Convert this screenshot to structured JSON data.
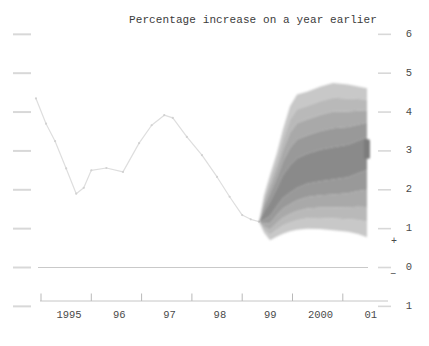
{
  "colors": {
    "background": "#ffffff",
    "history_line": "#dedede",
    "history_marker": "#d2d2d2",
    "zero_line": "#c9c9c9",
    "axis_line": "#c6c6c6",
    "axis_tick": "#b9b9b9",
    "side_tick": "#d8d8d8",
    "label_text": "#4a4a4a",
    "title_text": "#3b3b3b"
  },
  "chart_data": {
    "type": "area",
    "subtype": "fan-chart-projection",
    "title": "Percentage increase on a year earlier",
    "sign_labels": {
      "plus": "+",
      "minus": "−"
    },
    "y_axis": {
      "side": "right",
      "min": -1,
      "max": 6,
      "tick_values": [
        6,
        5,
        4,
        3,
        2,
        1,
        0,
        -1
      ],
      "tick_labels": [
        "6",
        "5",
        "4",
        "3",
        "2",
        "1",
        "0",
        "1"
      ]
    },
    "x_axis": {
      "tick_years": [
        1995,
        1996,
        1997,
        1998,
        1999,
        2000,
        2001
      ],
      "tick_labels": [
        "1995",
        "96",
        "97",
        "98",
        "99",
        "2000",
        "01"
      ]
    },
    "history_series": {
      "name": "outturn",
      "points": [
        [
          1994.9,
          4.35
        ],
        [
          1995.1,
          3.7
        ],
        [
          1995.28,
          3.25
        ],
        [
          1995.5,
          2.55
        ],
        [
          1995.7,
          1.9
        ],
        [
          1995.85,
          2.05
        ],
        [
          1996.0,
          2.5
        ],
        [
          1996.3,
          2.56
        ],
        [
          1996.63,
          2.46
        ],
        [
          1996.95,
          3.2
        ],
        [
          1997.2,
          3.66
        ],
        [
          1997.45,
          3.92
        ],
        [
          1997.62,
          3.85
        ],
        [
          1997.9,
          3.36
        ],
        [
          1998.2,
          2.89
        ],
        [
          1998.5,
          2.33
        ],
        [
          1998.75,
          1.82
        ],
        [
          1999.0,
          1.35
        ],
        [
          1999.17,
          1.24
        ],
        [
          1999.334,
          1.18
        ]
      ]
    },
    "fan": {
      "fractions": [
        0.22,
        0.45,
        0.65,
        0.82,
        1.0
      ],
      "shades": [
        "#c8c8c8",
        "#b9b9b9",
        "#a9a9a9",
        "#999999",
        "#8a8a8a"
      ],
      "stations": [
        [
          1999.334,
          1.18,
          1.18,
          1.18
        ],
        [
          1999.433,
          0.9,
          1.32,
          1.85
        ],
        [
          1999.553,
          0.7,
          1.5,
          2.38
        ],
        [
          1999.692,
          0.8,
          1.8,
          2.95
        ],
        [
          1999.811,
          0.87,
          2.05,
          3.55
        ],
        [
          1999.95,
          0.93,
          2.2,
          4.15
        ],
        [
          2000.09,
          0.97,
          2.35,
          4.45
        ],
        [
          2000.288,
          1.0,
          2.48,
          4.52
        ],
        [
          2000.547,
          0.99,
          2.57,
          4.65
        ],
        [
          2000.805,
          0.96,
          2.63,
          4.75
        ],
        [
          2001.103,
          0.92,
          2.72,
          4.71
        ],
        [
          2001.302,
          0.86,
          2.87,
          4.66
        ],
        [
          2001.481,
          0.78,
          3.0,
          4.61
        ]
      ],
      "end_marker": {
        "year_start": 2001.42,
        "year_end": 2001.54,
        "value_low": 2.8,
        "value_high": 3.3,
        "color": "#7b7b7b"
      }
    },
    "pixel_map": {
      "x_at_1995": 41,
      "px_per_year": 50.3,
      "y_at_zero": 267.5,
      "px_per_unit": 38.86,
      "plot_left": 40,
      "plot_right": 388,
      "zero_left": 38,
      "zero_right": 368,
      "axis_y": 301,
      "left_tick_x1": 13,
      "left_tick_x2": 31,
      "right_tick_x1": 378,
      "right_tick_x2": 391
    }
  }
}
